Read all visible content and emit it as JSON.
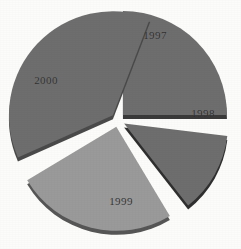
{
  "chart_data": {
    "type": "pie",
    "title": "",
    "subtitle": "",
    "xlabel": "",
    "ylabel": "",
    "legend_position": "none",
    "grid": false,
    "exploded": true,
    "style": "3d-exploded-pie-grayscale",
    "categories": [
      "1997",
      "1998",
      "1999",
      "2000"
    ],
    "values": [
      25,
      12.5,
      25,
      37.5
    ],
    "value_unit": "percent",
    "labels": [
      "1997",
      "1998",
      "1999",
      "2000"
    ],
    "slices": [
      {
        "label": "1997",
        "value": 25,
        "start_angle_deg": 0,
        "end_angle_deg": 90,
        "color": "#6e6e6e",
        "edge_color": "#3a3a3a",
        "label_x": 155,
        "label_y": 35
      },
      {
        "label": "1998",
        "value": 12.5,
        "start_angle_deg": 97,
        "end_angle_deg": 142,
        "color": "#6e6e6e",
        "edge_color": "#2f2f2f",
        "label_x": 203,
        "label_y": 113
      },
      {
        "label": "1999",
        "value": 25,
        "start_angle_deg": 149,
        "end_angle_deg": 239,
        "color": "#9a9a9a",
        "edge_color": "#565656",
        "label_x": 121,
        "label_y": 201
      },
      {
        "label": "2000",
        "value": 37.5,
        "start_angle_deg": 246,
        "end_angle_deg": 381,
        "color": "#6e6e6e",
        "edge_color": "#4a4a4a",
        "label_x": 46,
        "label_y": 80
      }
    ],
    "center_x": 118,
    "center_y": 120,
    "radius": 104,
    "explode_offset": 7,
    "background_color": "#fcfcfa",
    "label_color": "#2b2b2b"
  }
}
